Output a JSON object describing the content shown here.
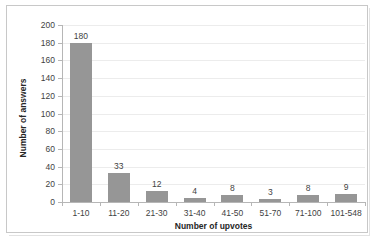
{
  "chart_data": {
    "type": "bar",
    "title": "",
    "xlabel": "Number of upvotes",
    "ylabel": "Number of answers",
    "categories": [
      "1-10",
      "11-20",
      "21-30",
      "31-40",
      "41-50",
      "51-70",
      "71-100",
      "101-548"
    ],
    "values": [
      180,
      33,
      12,
      4,
      8,
      3,
      8,
      9
    ],
    "data_labels": [
      "180",
      "33",
      "12",
      "4",
      "8",
      "3",
      "8",
      "9"
    ],
    "ylim": [
      0,
      200
    ],
    "y_ticks": [
      200,
      180,
      160,
      140,
      120,
      100,
      80,
      60,
      40,
      20,
      0
    ],
    "y_tick_labels": [
      "200",
      "180",
      "160",
      "140",
      "120",
      "100",
      "80",
      "60",
      "40",
      "20",
      "0"
    ],
    "grid": true,
    "grid_axis": "y",
    "legend": false,
    "legend_position": "none",
    "bar_color": "#969696",
    "gridline_color": "#ececec",
    "axis_color": "#b6b6b6",
    "text_color": "#3f3f3f",
    "plot_background": "#ffffff",
    "border_color": "#c8c8c8"
  }
}
